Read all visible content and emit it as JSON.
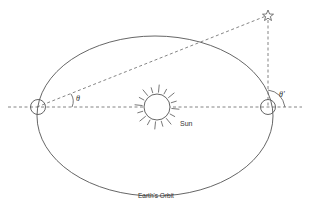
{
  "diagram": {
    "labels": {
      "sun": "Sun",
      "orbit": "Earth's Orbit",
      "angle_left": "θ",
      "angle_right": "θ'"
    },
    "icons": {
      "star": "star-icon",
      "sun": "sun-icon",
      "earth_left": "earth-position-icon",
      "earth_right": "earth-position-icon"
    },
    "colors": {
      "line": "#555555",
      "background": "#ffffff"
    }
  }
}
